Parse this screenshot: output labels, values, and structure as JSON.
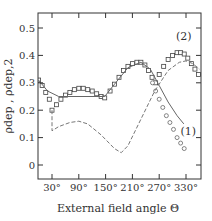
{
  "chart_data": {
    "type": "line",
    "title": "",
    "xlabel": "External field angle Θ",
    "ylabel": "ρdep , ρdep,2",
    "xlim": [
      0,
      365
    ],
    "ylim": [
      -0.05,
      0.55
    ],
    "xticks": [
      30,
      90,
      150,
      210,
      270,
      330
    ],
    "xtick_labels": [
      "30°",
      "90°",
      "150°",
      "210°",
      "270°",
      "330°"
    ],
    "yticks": [
      0,
      0.1,
      0.2,
      0.3,
      0.4,
      0.5
    ],
    "ytick_labels": [
      "0",
      "0.1",
      "0.2",
      "0.3",
      "0.4",
      "0.5"
    ],
    "grid": false,
    "annotations": [
      {
        "text": "(1)",
        "x": 335,
        "y": 0.11
      },
      {
        "text": "(2)",
        "x": 325,
        "y": 0.455
      }
    ],
    "series": [
      {
        "name": "(2) squares",
        "marker": "square",
        "x": [
          0,
          8,
          16,
          24,
          30,
          40,
          50,
          60,
          70,
          80,
          90,
          100,
          110,
          120,
          130,
          140,
          148,
          160,
          170,
          180,
          190,
          200,
          210,
          220,
          229,
          238,
          246,
          254,
          262,
          270,
          280,
          290,
          300,
          310,
          318,
          326,
          334,
          342,
          350,
          358
        ],
        "y": [
          0.31,
          0.29,
          0.265,
          0.24,
          0.2,
          0.22,
          0.24,
          0.255,
          0.265,
          0.275,
          0.28,
          0.28,
          0.275,
          0.27,
          0.26,
          0.25,
          0.245,
          0.27,
          0.295,
          0.32,
          0.345,
          0.36,
          0.37,
          0.375,
          0.375,
          0.365,
          0.345,
          0.32,
          0.3,
          0.33,
          0.36,
          0.385,
          0.4,
          0.41,
          0.41,
          0.405,
          0.39,
          0.37,
          0.35,
          0.33
        ]
      },
      {
        "name": "(1) circles",
        "marker": "circle",
        "x": [
          255,
          262,
          270,
          278,
          286,
          294,
          302,
          310,
          318,
          326
        ],
        "y": [
          0.3,
          0.27,
          0.24,
          0.21,
          0.18,
          0.155,
          0.13,
          0.1,
          0.08,
          0.06
        ]
      },
      {
        "name": "(1) solid",
        "style": "solid",
        "x": [
          0,
          20,
          45,
          148,
          170,
          200,
          229,
          250,
          270,
          290,
          310,
          325
        ],
        "y": [
          0.31,
          0.27,
          0.25,
          0.25,
          0.295,
          0.355,
          0.375,
          0.35,
          0.29,
          0.23,
          0.18,
          0.15
        ]
      },
      {
        "name": "(2) dashed",
        "style": "dashed",
        "x": [
          30,
          30,
          45,
          70,
          90,
          110,
          140,
          170,
          185,
          200,
          230,
          260,
          290,
          315,
          330,
          345,
          360
        ],
        "y": [
          0.2,
          0.125,
          0.14,
          0.155,
          0.16,
          0.15,
          0.11,
          0.06,
          0.045,
          0.07,
          0.17,
          0.27,
          0.345,
          0.375,
          0.38,
          0.37,
          0.35
        ]
      }
    ]
  }
}
